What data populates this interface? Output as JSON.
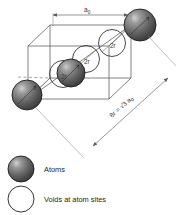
{
  "figure": {
    "name": "bcc-unit-cell-diagram",
    "colors": {
      "atom_dark": "#4a4a4a",
      "atom_mid": "#6d6d6d",
      "atom_highlight": "#c9c9c9",
      "atom_outline": "#1c1c1c",
      "void_fill": "#ffffff",
      "void_stroke": "#2b2b2b",
      "cell_line": "#555555",
      "dim_line": "#6a6a6a",
      "text": "#1d1d1d"
    }
  },
  "dimensions": {
    "lattice_parameter": {
      "label": "a",
      "subscript": "0",
      "name": "lattice-parameter-a0"
    },
    "body_diagonal": {
      "label": "8r = √3 a",
      "subscript": "0",
      "name": "body-diagonal-8r"
    },
    "radii": [
      {
        "label": "2r",
        "name": "diameter-label-top"
      },
      {
        "label": "2r",
        "name": "diameter-label-middle"
      },
      {
        "label": "2r",
        "name": "diameter-label-lower"
      }
    ]
  },
  "legend": {
    "items": [
      {
        "label": "Atoms",
        "symbol": "filled-sphere"
      },
      {
        "label": "Voids at atom sites",
        "symbol": "open-circle"
      }
    ]
  }
}
